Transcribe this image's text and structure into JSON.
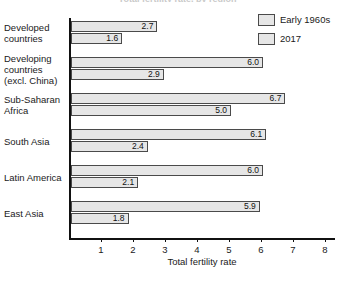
{
  "chart_data": {
    "type": "bar",
    "orientation": "horizontal",
    "title": "Total fertility rate, by region",
    "xlabel": "Total fertility rate",
    "ylabel": "",
    "xlim": [
      0,
      8.3
    ],
    "xticks": [
      1,
      2,
      3,
      4,
      5,
      6,
      7,
      8
    ],
    "grid": false,
    "legend_position": "top-right",
    "categories": [
      "Developed countries",
      "Developing countries (excl. China)",
      "Sub-Saharan Africa",
      "South Asia",
      "Latin America",
      "East Asia"
    ],
    "category_lines": [
      [
        "Developed",
        "countries"
      ],
      [
        "Developing",
        "countries",
        "(excl. China)"
      ],
      [
        "Sub-Saharan",
        "Africa"
      ],
      [
        "South Asia"
      ],
      [
        "Latin America"
      ],
      [
        "East Asia"
      ]
    ],
    "series": [
      {
        "name": "Early 1960s",
        "values": [
          2.7,
          6.0,
          6.7,
          6.1,
          6.0,
          5.9
        ],
        "labels": [
          "2.7",
          "6.0",
          "6.7",
          "6.1",
          "6.0",
          "5.9"
        ]
      },
      {
        "name": "2017",
        "values": [
          1.6,
          2.9,
          5.0,
          2.4,
          2.1,
          1.8
        ],
        "labels": [
          "1.6",
          "2.9",
          "5.0",
          "2.4",
          "2.1",
          "1.8"
        ]
      }
    ]
  },
  "colors": {
    "bar_fill": "#e6e6e6",
    "bar_border": "#4a4a4a",
    "axis": "#111111",
    "text": "#1a1a1a",
    "background": "#ffffff"
  }
}
